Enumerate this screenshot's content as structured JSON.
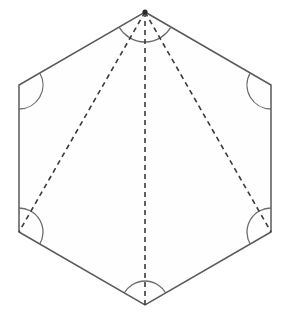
{
  "figure": {
    "shape_name": "regular-hexagon",
    "canvas": {
      "width": 291,
      "height": 324
    },
    "background_color": "#ffffff",
    "edge_color": "#595959",
    "face_color": "#fefefe",
    "diagonal_color": "#3a3a3a",
    "arc_color": "#6b6b6b",
    "edge_stroke_width": 1.5,
    "diagonal_stroke_width": 1.6,
    "diagonal_dash_pattern": "5 4",
    "arc_stroke_width": 1.3
  },
  "vertices": [
    {
      "id": "apex",
      "name": "top-vertex",
      "x": 145,
      "y": 12,
      "arc_radius": 30,
      "has_dot": true
    },
    {
      "id": "upper_right",
      "name": "upper-right-vertex",
      "x": 271,
      "y": 85,
      "arc_radius": 24,
      "has_dot": false
    },
    {
      "id": "lower_right",
      "name": "lower-right-vertex",
      "x": 271,
      "y": 232,
      "arc_radius": 24,
      "has_dot": false
    },
    {
      "id": "bottom",
      "name": "bottom-vertex",
      "x": 145,
      "y": 305,
      "arc_radius": 24,
      "has_dot": false
    },
    {
      "id": "lower_left",
      "name": "lower-left-vertex",
      "x": 19,
      "y": 232,
      "arc_radius": 24,
      "has_dot": false
    },
    {
      "id": "upper_left",
      "name": "upper-left-vertex",
      "x": 19,
      "y": 85,
      "arc_radius": 24,
      "has_dot": false
    }
  ],
  "hexagon_path": "M 145 12 L 271 85 L 271 232 L 145 305 L 19 232 L 19 85 Z",
  "diagonals": [
    {
      "id": "apex-to-lower-left",
      "name": "diagonal-apex-lower-left",
      "x1": 145,
      "y1": 12,
      "x2": 19,
      "y2": 232
    },
    {
      "id": "apex-to-bottom",
      "name": "diagonal-apex-bottom",
      "x1": 145,
      "y1": 12,
      "x2": 145,
      "y2": 305
    },
    {
      "id": "apex-to-lower-right",
      "name": "diagonal-apex-lower-right",
      "x1": 145,
      "y1": 12,
      "x2": 271,
      "y2": 232
    }
  ],
  "angle_arcs": [
    {
      "id": "arc-apex",
      "name": "angle-arc-top-vertex",
      "cx": 145,
      "cy": 12,
      "r": 30,
      "start_deg": 30,
      "end_deg": 150
    },
    {
      "id": "arc-upper-right",
      "name": "angle-arc-upper-right-vertex",
      "cx": 271,
      "cy": 85,
      "r": 24,
      "start_deg": 90,
      "end_deg": 210
    },
    {
      "id": "arc-lower-right",
      "name": "angle-arc-lower-right-vertex",
      "cx": 271,
      "cy": 232,
      "r": 24,
      "start_deg": 150,
      "end_deg": 270
    },
    {
      "id": "arc-bottom",
      "name": "angle-arc-bottom-vertex",
      "cx": 145,
      "cy": 305,
      "r": 24,
      "start_deg": 210,
      "end_deg": 330
    },
    {
      "id": "arc-lower-left",
      "name": "angle-arc-lower-left-vertex",
      "cx": 19,
      "cy": 232,
      "r": 24,
      "start_deg": 270,
      "end_deg": 30
    },
    {
      "id": "arc-upper-left",
      "name": "angle-arc-upper-left-vertex",
      "cx": 19,
      "cy": 85,
      "r": 24,
      "start_deg": 330,
      "end_deg": 90
    }
  ]
}
